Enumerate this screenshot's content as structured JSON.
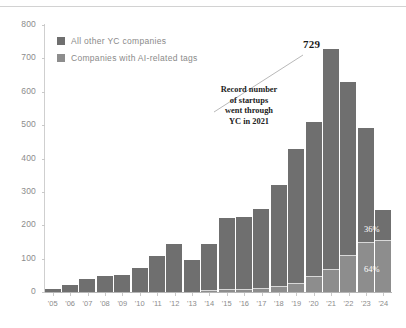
{
  "legend": {
    "items": [
      {
        "label": "All other YC companies",
        "color": "#6f6f6f",
        "icon": "square-swatch-icon"
      },
      {
        "label": "Companies with AI-related tags",
        "color": "#8d8d8d",
        "icon": "square-swatch-icon"
      }
    ]
  },
  "annotation": {
    "peak_value_label": "729",
    "callout_text": "Record number of startups went through YC in 2021",
    "callout_lines": [
      "Record number",
      "of startups",
      "went through",
      "YC in 2021"
    ]
  },
  "segment_labels": {
    "ai_share": "36%",
    "other_share": "64%"
  },
  "chart_data": {
    "type": "bar",
    "stacked": true,
    "title": "",
    "subtitle": "",
    "xlabel": "",
    "ylabel": "",
    "ylim": [
      0,
      800
    ],
    "yticks": [
      0,
      100,
      200,
      300,
      400,
      500,
      600,
      700,
      800
    ],
    "ytick_labels": [
      "0",
      "100",
      "200",
      "300",
      "400",
      "500",
      "600",
      "700",
      "800"
    ],
    "grid": false,
    "legend_position": "top-left",
    "categories": [
      "'05",
      "'06",
      "'07",
      "'08",
      "'09",
      "'10",
      "'11",
      "'12",
      "'13",
      "'14",
      "'15",
      "'16",
      "'17",
      "'18",
      "'19",
      "'20",
      "'21",
      "'22",
      "'23",
      "'24"
    ],
    "series": [
      {
        "name": "Companies with AI-related tags",
        "color": "#8d8d8d",
        "values": [
          0,
          0,
          0,
          0,
          0,
          0,
          0,
          0,
          0,
          5,
          8,
          10,
          12,
          18,
          28,
          48,
          70,
          110,
          150,
          157
        ]
      },
      {
        "name": "All other YC companies",
        "color": "#6f6f6f",
        "values": [
          8,
          22,
          38,
          48,
          50,
          73,
          108,
          145,
          97,
          140,
          214,
          215,
          238,
          302,
          402,
          462,
          659,
          520,
          340,
          88
        ]
      }
    ],
    "totals": [
      8,
      22,
      38,
      48,
      50,
      73,
      108,
      145,
      97,
      145,
      222,
      225,
      250,
      320,
      430,
      510,
      729,
      630,
      490,
      245
    ],
    "annotations": [
      {
        "category": "'21",
        "value": 729,
        "text": "729"
      },
      {
        "category": "'24",
        "text": "36%",
        "refers_to": "Companies with AI-related tags"
      },
      {
        "category": "'24",
        "text": "64%",
        "refers_to": "All other YC companies"
      }
    ]
  }
}
